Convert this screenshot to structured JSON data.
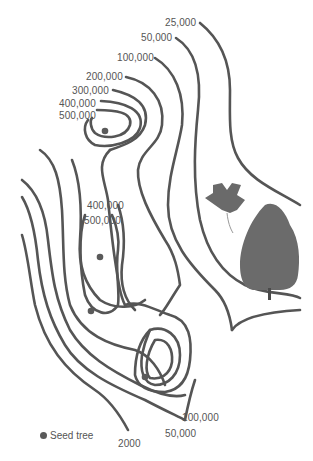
{
  "diagram": {
    "type": "contour map of seed dispersal density",
    "contour_color": "#555555",
    "seed_dot_color": "#5a5a5a",
    "labels_top": [
      "25,000",
      "50,000",
      "100,000",
      "200,000",
      "300,000",
      "400,000",
      "500,000"
    ],
    "labels_middle": [
      "400,000",
      "500,000"
    ],
    "labels_bottom": [
      "100,000",
      "50,000",
      "2000"
    ],
    "legend": {
      "symbol": "dot",
      "label": "Seed tree"
    },
    "seed_trees": 4,
    "illustrations": [
      "tulip-tree-leaf",
      "tree"
    ]
  }
}
